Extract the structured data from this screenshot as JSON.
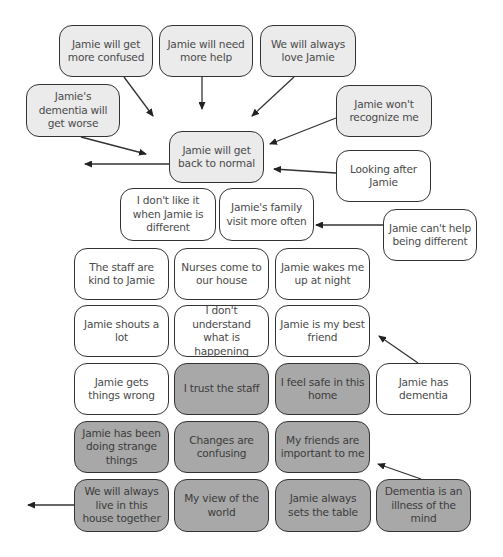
{
  "colors": {
    "light_fill": "#ebebeb",
    "white_fill": "#ffffff",
    "dark_fill": "#a8a8a8",
    "border": "#333333",
    "text": "#4a4a4a"
  },
  "cards": [
    {
      "id": "more-confused",
      "text": "Jamie will get more confused",
      "fill": "light",
      "x": 59,
      "y": 25,
      "w": 94,
      "h": 52
    },
    {
      "id": "more-help",
      "text": "Jamie will need more help",
      "fill": "light",
      "x": 159,
      "y": 25,
      "w": 94,
      "h": 52
    },
    {
      "id": "always-love",
      "text": "We will always love Jamie",
      "fill": "light",
      "x": 260,
      "y": 25,
      "w": 96,
      "h": 52
    },
    {
      "id": "dementia-worse",
      "text": "Jamie's dementia will get worse",
      "fill": "light",
      "x": 26,
      "y": 84,
      "w": 94,
      "h": 53
    },
    {
      "id": "wont-recognize",
      "text": "Jamie won't recognize me",
      "fill": "light",
      "x": 336,
      "y": 85,
      "w": 96,
      "h": 52
    },
    {
      "id": "back-to-normal",
      "text": "Jamie will get back to normal",
      "fill": "light",
      "x": 169,
      "y": 131,
      "w": 95,
      "h": 52
    },
    {
      "id": "looking-after",
      "text": "Looking after Jamie",
      "fill": "white",
      "x": 336,
      "y": 150,
      "w": 95,
      "h": 52
    },
    {
      "id": "dont-like-different",
      "text": "I don't like it when Jamie is different",
      "fill": "white",
      "x": 120,
      "y": 188,
      "w": 96,
      "h": 53
    },
    {
      "id": "family-visit",
      "text": "Jamie's family visit more often",
      "fill": "white",
      "x": 219,
      "y": 188,
      "w": 95,
      "h": 53
    },
    {
      "id": "cant-help",
      "text": "Jamie can't help being different",
      "fill": "white",
      "x": 383,
      "y": 209,
      "w": 94,
      "h": 52
    },
    {
      "id": "staff-kind",
      "text": "The staff are kind to Jamie",
      "fill": "white",
      "x": 74,
      "y": 248,
      "w": 95,
      "h": 52
    },
    {
      "id": "nurses-come",
      "text": "Nurses come to our house",
      "fill": "white",
      "x": 174,
      "y": 248,
      "w": 95,
      "h": 52
    },
    {
      "id": "wakes-me",
      "text": "Jamie wakes me up at night",
      "fill": "white",
      "x": 275,
      "y": 248,
      "w": 95,
      "h": 52
    },
    {
      "id": "shouts",
      "text": "Jamie shouts a lot",
      "fill": "white",
      "x": 74,
      "y": 305,
      "w": 95,
      "h": 52
    },
    {
      "id": "dont-understand",
      "text": "I don't understand what is happening",
      "fill": "white",
      "x": 174,
      "y": 305,
      "w": 95,
      "h": 52
    },
    {
      "id": "best-friend",
      "text": "Jamie is my best friend",
      "fill": "white",
      "x": 275,
      "y": 305,
      "w": 95,
      "h": 52
    },
    {
      "id": "gets-wrong",
      "text": "Jamie gets things wrong",
      "fill": "white",
      "x": 74,
      "y": 363,
      "w": 95,
      "h": 52
    },
    {
      "id": "trust-staff",
      "text": "I trust the staff",
      "fill": "dark",
      "x": 174,
      "y": 363,
      "w": 95,
      "h": 52
    },
    {
      "id": "feel-safe",
      "text": "I feel safe in this home",
      "fill": "dark",
      "x": 275,
      "y": 363,
      "w": 95,
      "h": 52
    },
    {
      "id": "has-dementia",
      "text": "Jamie has dementia",
      "fill": "white",
      "x": 376,
      "y": 363,
      "w": 95,
      "h": 52
    },
    {
      "id": "strange-things",
      "text": "Jamie has been doing strange things",
      "fill": "dark",
      "x": 74,
      "y": 421,
      "w": 95,
      "h": 52
    },
    {
      "id": "changes-confusing",
      "text": "Changes are confusing",
      "fill": "dark",
      "x": 174,
      "y": 421,
      "w": 95,
      "h": 52
    },
    {
      "id": "friends-important",
      "text": "My friends are important to me",
      "fill": "dark",
      "x": 275,
      "y": 421,
      "w": 95,
      "h": 52
    },
    {
      "id": "live-together",
      "text": "We will always live in this house together",
      "fill": "dark",
      "x": 74,
      "y": 479,
      "w": 95,
      "h": 53
    },
    {
      "id": "my-view",
      "text": "My view of the world",
      "fill": "dark",
      "x": 174,
      "y": 479,
      "w": 95,
      "h": 53
    },
    {
      "id": "sets-table",
      "text": "Jamie always sets the table",
      "fill": "dark",
      "x": 275,
      "y": 479,
      "w": 96,
      "h": 53
    },
    {
      "id": "illness-of-mind",
      "text": "Dementia is an illness of the mind",
      "fill": "dark",
      "x": 376,
      "y": 479,
      "w": 95,
      "h": 53
    }
  ],
  "arrows": [
    {
      "from": "more-confused",
      "x1": 124,
      "y1": 77,
      "x2": 153,
      "y2": 116
    },
    {
      "from": "more-help",
      "x1": 202,
      "y1": 77,
      "x2": 202,
      "y2": 109
    },
    {
      "from": "always-love",
      "x1": 294,
      "y1": 77,
      "x2": 252,
      "y2": 116
    },
    {
      "from": "dementia-worse",
      "x1": 81,
      "y1": 137,
      "x2": 146,
      "y2": 154
    },
    {
      "from": "wont-recognize",
      "x1": 336,
      "y1": 118,
      "x2": 270,
      "y2": 144
    },
    {
      "from": "back-to-normal",
      "x1": 169,
      "y1": 164,
      "x2": 85,
      "y2": 164
    },
    {
      "from": "looking-after",
      "x1": 336,
      "y1": 173,
      "x2": 274,
      "y2": 169
    },
    {
      "from": "cant-help",
      "x1": 383,
      "y1": 225,
      "x2": 316,
      "y2": 225
    },
    {
      "from": "has-dementia",
      "x1": 418,
      "y1": 363,
      "x2": 379,
      "y2": 336
    },
    {
      "from": "live-together",
      "x1": 74,
      "y1": 505,
      "x2": 28,
      "y2": 505
    },
    {
      "from": "illness-of-mind",
      "x1": 421,
      "y1": 479,
      "x2": 378,
      "y2": 464
    }
  ]
}
